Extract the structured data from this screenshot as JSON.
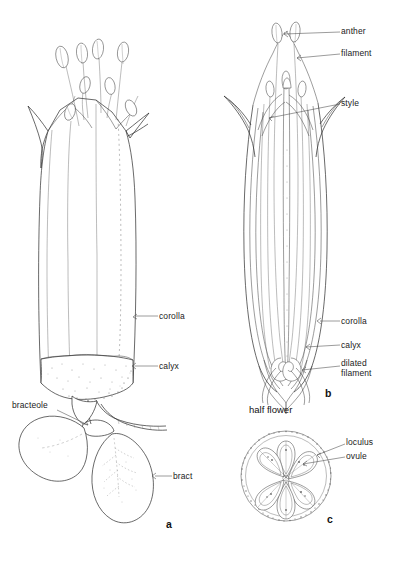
{
  "plate": {
    "title": "Flower structure plate",
    "background_color": "#ffffff",
    "ink_color": "#2a2a2a",
    "text_color": "#1b1b1b"
  },
  "panel_a": {
    "figure_letter": "a",
    "labels": {
      "corolla": "corolla",
      "calyx": "calyx",
      "bracteole": "bracteole",
      "bract": "bract"
    }
  },
  "panel_b": {
    "figure_letter": "b",
    "caption": "half flower",
    "labels": {
      "anther": "anther",
      "filament": "filament",
      "style": "style",
      "corolla": "corolla",
      "calyx": "calyx",
      "dilated_filament": "dilated filament"
    }
  },
  "panel_c": {
    "figure_letter": "c",
    "labels": {
      "loculus": "loculus",
      "ovule": "ovule"
    }
  }
}
